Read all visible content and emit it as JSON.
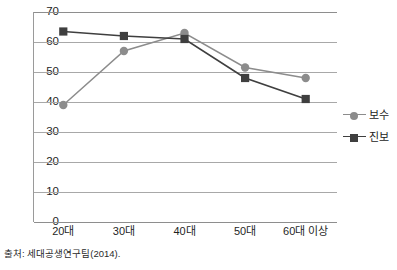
{
  "chart_data": {
    "type": "line",
    "title": "",
    "xlabel": "",
    "ylabel": "",
    "categories": [
      "20대",
      "30대",
      "40대",
      "50대",
      "60대 이상"
    ],
    "ylim": [
      0,
      70
    ],
    "ytick_labels": [
      "70",
      "60",
      "50",
      "40",
      "30",
      "20",
      "10",
      "0"
    ],
    "ytick_values": [
      70,
      60,
      50,
      40,
      30,
      20,
      10,
      0
    ],
    "grid": true,
    "grid_axis": "y",
    "legend_position": "right",
    "series": [
      {
        "name": "보수",
        "marker": "circle",
        "color": "#8c8c8c",
        "values": [
          39,
          57,
          63,
          51.5,
          48
        ]
      },
      {
        "name": "진보",
        "marker": "square",
        "color": "#3f3f3f",
        "values": [
          63.5,
          62,
          61,
          48,
          41
        ]
      }
    ]
  },
  "legend": {
    "items": [
      {
        "label": "보수",
        "marker": "circle-marker",
        "color": "#8c8c8c"
      },
      {
        "label": "진보",
        "marker": "square-marker",
        "color": "#3f3f3f"
      }
    ]
  },
  "source": {
    "text": "출처: 세대공생연구팀(2014)."
  },
  "colors": {
    "conservative": "#8c8c8c",
    "progressive": "#3f3f3f",
    "gridline": "#a8a8a8",
    "axis": "#8e8e8e",
    "text": "#1f1f1f",
    "background": "#ffffff"
  }
}
